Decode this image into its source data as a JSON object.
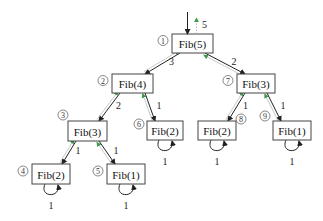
{
  "diagram": {
    "colors": {
      "call_arrow": "#222222",
      "return_arrow": "#3a9a4a",
      "box_stroke": "#444444"
    },
    "nodes": [
      {
        "id": "n1",
        "label": "Fib(5)",
        "order": "1",
        "x": 172,
        "y": 34,
        "w": 41,
        "h": 19
      },
      {
        "id": "n2",
        "label": "Fib(4)",
        "order": "2",
        "x": 112,
        "y": 74,
        "w": 41,
        "h": 19
      },
      {
        "id": "n3",
        "label": "Fib(3)",
        "order": "3",
        "x": 68,
        "y": 121,
        "w": 39,
        "h": 20
      },
      {
        "id": "n4",
        "label": "Fib(2)",
        "order": "4",
        "x": 32,
        "y": 164,
        "w": 38,
        "h": 20
      },
      {
        "id": "n5",
        "label": "Fib(1)",
        "order": "5",
        "x": 107,
        "y": 164,
        "w": 38,
        "h": 20
      },
      {
        "id": "n6",
        "label": "Fib(2)",
        "order": "6",
        "x": 147,
        "y": 121,
        "w": 36,
        "h": 19
      },
      {
        "id": "n7",
        "label": "Fib(3)",
        "order": "7",
        "x": 237,
        "y": 74,
        "w": 38,
        "h": 19
      },
      {
        "id": "n8",
        "label": "Fib(2)",
        "order": "8",
        "x": 198,
        "y": 121,
        "w": 38,
        "h": 19
      },
      {
        "id": "n9",
        "label": "Fib(1)",
        "order": "9",
        "x": 273,
        "y": 121,
        "w": 38,
        "h": 19
      }
    ],
    "edges": [
      {
        "from": "n1",
        "to": "n2",
        "return_value": "3"
      },
      {
        "from": "n1",
        "to": "n7",
        "return_value": "2"
      },
      {
        "from": "n2",
        "to": "n3",
        "return_value": "2"
      },
      {
        "from": "n2",
        "to": "n6",
        "return_value": "1"
      },
      {
        "from": "n3",
        "to": "n4",
        "return_value": "1"
      },
      {
        "from": "n3",
        "to": "n5",
        "return_value": "1"
      },
      {
        "from": "n7",
        "to": "n8",
        "return_value": "1"
      },
      {
        "from": "n7",
        "to": "n9",
        "return_value": "1"
      }
    ],
    "self_loops": [
      {
        "node": "n4",
        "value": "1"
      },
      {
        "node": "n5",
        "value": "1"
      },
      {
        "node": "n6",
        "value": "1"
      },
      {
        "node": "n8",
        "value": "1"
      },
      {
        "node": "n9",
        "value": "1"
      }
    ],
    "root_return_value": "5",
    "order_marks": [
      "①",
      "②",
      "③",
      "④",
      "⑤",
      "⑥",
      "⑦",
      "⑧",
      "⑨"
    ]
  }
}
